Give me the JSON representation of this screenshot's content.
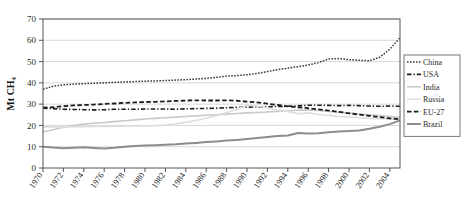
{
  "chart_data": {
    "type": "line",
    "title": "",
    "xlabel": "",
    "ylabel": "Mt CH4",
    "ylabel_display": "Mt CH₄",
    "xlim": [
      1970,
      2005
    ],
    "ylim": [
      0,
      70
    ],
    "ytick_step": 10,
    "xtick_step": 2,
    "grid": true,
    "grid_axis": "y",
    "legend_position": "right",
    "yticks": [
      0,
      10,
      20,
      30,
      40,
      50,
      60,
      70
    ],
    "ytick_labels": [
      "0",
      "10",
      "20",
      "30",
      "40",
      "50",
      "60",
      "70"
    ],
    "x": [
      1970,
      1971,
      1972,
      1973,
      1974,
      1975,
      1976,
      1977,
      1978,
      1979,
      1980,
      1981,
      1982,
      1983,
      1984,
      1985,
      1986,
      1987,
      1988,
      1989,
      1990,
      1991,
      1992,
      1993,
      1994,
      1995,
      1996,
      1997,
      1998,
      1999,
      2000,
      2001,
      2002,
      2003,
      2004,
      2005
    ],
    "xtick_labels": [
      "1970",
      "1972",
      "1974",
      "1976",
      "1978",
      "1980",
      "1982",
      "1984",
      "1986",
      "1988",
      "1990",
      "1992",
      "1994",
      "1996",
      "1998",
      "2000",
      "2002",
      "2004"
    ],
    "series": [
      {
        "name": "China",
        "color": "#3a3a3a",
        "style": "dotted",
        "width": 1.5,
        "values": [
          37.0,
          38.4,
          39.1,
          39.4,
          39.6,
          39.8,
          40.0,
          40.2,
          40.4,
          40.6,
          40.8,
          40.9,
          41.1,
          41.3,
          41.5,
          41.8,
          42.1,
          42.6,
          43.2,
          43.4,
          43.8,
          44.4,
          45.3,
          46.2,
          46.9,
          47.6,
          48.4,
          49.5,
          51.2,
          51.4,
          50.9,
          50.6,
          50.4,
          52.0,
          55.8,
          61.2
        ]
      },
      {
        "name": "USA",
        "color": "#1c1c1c",
        "style": "dashdot",
        "width": 1.6,
        "values": [
          28.1,
          27.9,
          27.6,
          27.5,
          27.4,
          27.3,
          27.4,
          27.6,
          27.6,
          27.6,
          27.7,
          27.7,
          27.7,
          27.6,
          27.8,
          27.9,
          28.0,
          28.1,
          28.3,
          28.5,
          28.6,
          28.7,
          28.8,
          28.9,
          29.0,
          29.2,
          29.5,
          29.5,
          29.4,
          29.3,
          29.4,
          29.3,
          29.1,
          29.0,
          29.1,
          29.0
        ]
      },
      {
        "name": "India",
        "color": "#c9c9c9",
        "style": "solid",
        "width": 1.6,
        "values": [
          16.9,
          18.0,
          19.2,
          20.0,
          20.6,
          21.0,
          21.4,
          21.8,
          22.2,
          22.6,
          23.0,
          23.3,
          23.6,
          23.9,
          24.2,
          24.5,
          24.8,
          25.0,
          25.3,
          25.6,
          25.9,
          26.1,
          26.3,
          26.6,
          26.9,
          27.1,
          27.3,
          27.0,
          26.6,
          26.2,
          25.8,
          25.4,
          25.0,
          24.6,
          24.2,
          23.8
        ]
      },
      {
        "name": "Russia",
        "color": "#dedede",
        "style": "solid",
        "width": 1.6,
        "values": [
          19.3,
          19.3,
          19.3,
          19.4,
          19.4,
          19.5,
          19.5,
          19.6,
          19.6,
          19.7,
          19.8,
          19.9,
          20.2,
          20.8,
          21.5,
          22.3,
          23.4,
          24.6,
          26.1,
          27.6,
          29.5,
          29.1,
          28.2,
          27.2,
          26.6,
          25.5,
          25.9,
          25.1,
          24.8,
          24.2,
          24.0,
          23.6,
          23.3,
          23.2,
          23.1,
          23.0
        ]
      },
      {
        "name": "EU-27",
        "color": "#1c1c1c",
        "style": "dashed",
        "width": 1.8,
        "values": [
          28.3,
          28.6,
          29.0,
          29.4,
          29.6,
          29.8,
          30.1,
          30.3,
          30.6,
          30.8,
          31.0,
          31.1,
          31.3,
          31.5,
          31.7,
          31.8,
          31.7,
          31.7,
          31.8,
          31.6,
          31.2,
          30.8,
          30.2,
          29.6,
          29.0,
          28.5,
          28.1,
          27.5,
          27.0,
          26.4,
          25.7,
          25.1,
          24.5,
          23.9,
          23.3,
          22.9
        ]
      },
      {
        "name": "Brazil",
        "color": "#8c8c8c",
        "style": "solid",
        "width": 2.0,
        "values": [
          10.0,
          9.6,
          9.3,
          9.5,
          9.7,
          9.4,
          9.2,
          9.5,
          10.0,
          10.3,
          10.6,
          10.7,
          10.9,
          11.1,
          11.5,
          11.8,
          12.2,
          12.5,
          12.9,
          13.2,
          13.6,
          14.1,
          14.6,
          15.0,
          15.3,
          16.4,
          16.2,
          16.3,
          16.8,
          17.2,
          17.4,
          17.6,
          18.4,
          19.4,
          20.6,
          22.4
        ]
      }
    ]
  },
  "legend": {
    "items": [
      {
        "label": "China"
      },
      {
        "label": "USA"
      },
      {
        "label": "India"
      },
      {
        "label": "Russia"
      },
      {
        "label": "EU-27"
      },
      {
        "label": "Brazil"
      }
    ]
  }
}
